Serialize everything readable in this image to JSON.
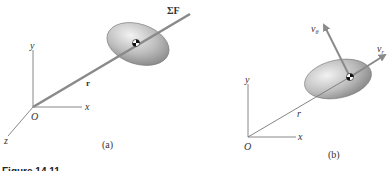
{
  "figure": {
    "caption_fragment": "Figure 14.11",
    "panels": [
      {
        "id": "a",
        "label": "(a)",
        "axes": {
          "origin": "O",
          "x": "x",
          "y": "y",
          "z": "z"
        },
        "vectors": {
          "position": "r",
          "force": "ΣF"
        }
      },
      {
        "id": "b",
        "label": "(b)",
        "axes": {
          "origin": "O",
          "x": "x",
          "y": "y"
        },
        "vectors": {
          "position": "r",
          "radial_velocity": "v",
          "radial_sub": "r",
          "transverse_velocity": "v",
          "transverse_sub": "θ"
        }
      }
    ]
  },
  "colors": {
    "rod": "#8a8a8a",
    "disc_light": "#e6e6e6",
    "disc_dark": "#9a9a9a",
    "axis": "#777777"
  }
}
